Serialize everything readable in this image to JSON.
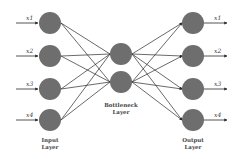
{
  "diagram": {
    "colors": {
      "node": "#6e6e6e",
      "edge": "#2a2a2a",
      "background": "#ffffff"
    },
    "layers": [
      {
        "name": "input",
        "label_line1": "Input",
        "label_line2": "Layer",
        "nodes": [
          "x1",
          "x2",
          "x3",
          "x4"
        ]
      },
      {
        "name": "bottleneck",
        "label_line1": "Bottleneck",
        "label_line2": "Layer",
        "nodes": [
          "b1",
          "b2"
        ]
      },
      {
        "name": "output",
        "label_line1": "Output",
        "label_line2": "Layer",
        "nodes": [
          "x1",
          "x2",
          "x3",
          "x4"
        ]
      }
    ],
    "input_vars": [
      "x1",
      "x2",
      "x3",
      "x4"
    ],
    "output_vars": [
      "x1",
      "x2",
      "x3",
      "x4"
    ],
    "connections": "fully connected input→bottleneck and bottleneck→output"
  }
}
